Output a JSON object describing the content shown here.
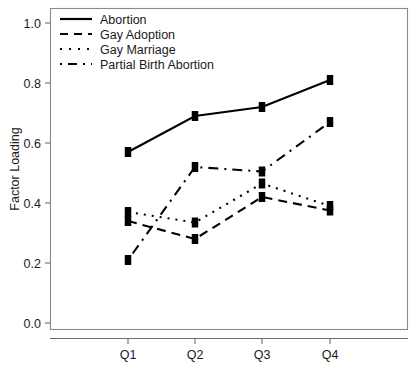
{
  "chart_data": {
    "type": "line",
    "title": "",
    "xlabel": "",
    "ylabel": "Factor Loading",
    "categories": [
      "Q1",
      "Q2",
      "Q3",
      "Q4"
    ],
    "ylim": [
      0.0,
      1.0
    ],
    "ytick_labels": [
      "0.0",
      "0.2",
      "0.4",
      "0.6",
      "0.8",
      "1.0"
    ],
    "ytick_values": [
      0.0,
      0.2,
      0.4,
      0.6,
      0.8,
      1.0
    ],
    "grid": false,
    "legend_position": "top-left",
    "marker": "square",
    "series": [
      {
        "name": "Abortion",
        "linestyle": "solid",
        "color": "#000000",
        "values": [
          0.57,
          0.69,
          0.72,
          0.81
        ]
      },
      {
        "name": "Gay Adoption",
        "linestyle": "dashed",
        "color": "#000000",
        "values": [
          0.34,
          0.28,
          0.42,
          0.375
        ]
      },
      {
        "name": "Gay Marriage",
        "linestyle": "dotted",
        "color": "#000000",
        "values": [
          0.37,
          0.335,
          0.465,
          0.39
        ]
      },
      {
        "name": "Partial Birth Abortion",
        "linestyle": "dashdot",
        "color": "#000000",
        "values": [
          0.21,
          0.52,
          0.505,
          0.67
        ]
      }
    ]
  },
  "axis": {
    "y_title": "Factor Loading",
    "y_ticks": [
      "1.0",
      "0.8",
      "0.6",
      "0.4",
      "0.2",
      "0.0"
    ],
    "x_ticks": [
      "Q1",
      "Q2",
      "Q3",
      "Q4"
    ]
  },
  "legend": {
    "entries": [
      {
        "label": "Abortion"
      },
      {
        "label": "Gay Adoption"
      },
      {
        "label": "Gay Marriage"
      },
      {
        "label": "Partial Birth Abortion"
      }
    ]
  }
}
